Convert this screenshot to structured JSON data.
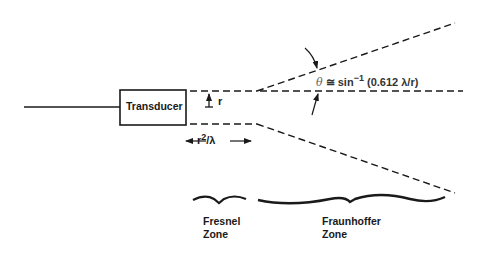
{
  "diagram": {
    "type": "transducer beam pattern",
    "transducer": {
      "label": "Transducer"
    },
    "radius": {
      "label": "r"
    },
    "near_field_length": {
      "base": "r",
      "exponent": "2",
      "suffix": "/λ"
    },
    "divergence_angle": {
      "symbol": "θ",
      "relation": "≅",
      "function": "sin",
      "exponent": "−1",
      "argument": "(0.612 λ/r)"
    },
    "zones": [
      {
        "name": "Fresnel",
        "line2": "Zone"
      },
      {
        "name": "Fraunhoffer",
        "line2": "Zone"
      }
    ],
    "colors": {
      "ink": "#1a1a1a",
      "background": "#ffffff"
    }
  }
}
